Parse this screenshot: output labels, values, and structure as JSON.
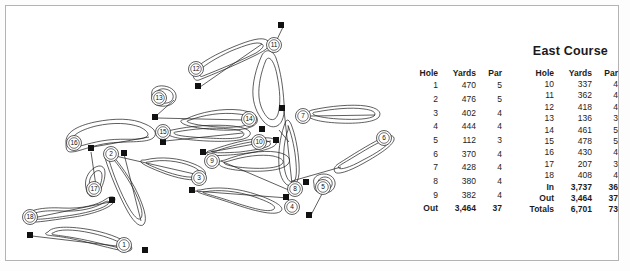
{
  "title": "East Course",
  "scorecard": {
    "columns": [
      "Hole",
      "Yards",
      "Par"
    ],
    "front": [
      {
        "hole": "1",
        "yards": "470",
        "par": "5"
      },
      {
        "hole": "2",
        "yards": "476",
        "par": "5"
      },
      {
        "hole": "3",
        "yards": "402",
        "par": "4"
      },
      {
        "hole": "4",
        "yards": "444",
        "par": "4"
      },
      {
        "hole": "5",
        "yards": "112",
        "par": "3"
      },
      {
        "hole": "6",
        "yards": "370",
        "par": "4"
      },
      {
        "hole": "7",
        "yards": "428",
        "par": "4"
      },
      {
        "hole": "8",
        "yards": "380",
        "par": "4"
      },
      {
        "hole": "9",
        "yards": "382",
        "par": "4"
      }
    ],
    "front_total": {
      "label": "Out",
      "yards": "3,464",
      "par": "37"
    },
    "back": [
      {
        "hole": "10",
        "yards": "337",
        "par": "4"
      },
      {
        "hole": "11",
        "yards": "362",
        "par": "4"
      },
      {
        "hole": "12",
        "yards": "418",
        "par": "4"
      },
      {
        "hole": "13",
        "yards": "136",
        "par": "3"
      },
      {
        "hole": "14",
        "yards": "461",
        "par": "5"
      },
      {
        "hole": "15",
        "yards": "478",
        "par": "5"
      },
      {
        "hole": "16",
        "yards": "430",
        "par": "4"
      },
      {
        "hole": "17",
        "yards": "207",
        "par": "3"
      },
      {
        "hole": "18",
        "yards": "408",
        "par": "4"
      }
    ],
    "back_totals": [
      {
        "label": "In",
        "yards": "3,737",
        "par": "36"
      },
      {
        "label": "Out",
        "yards": "3,464",
        "par": "37"
      },
      {
        "label": "Totals",
        "yards": "6,701",
        "par": "73"
      }
    ]
  },
  "map": {
    "stroke_color": "#1a1a1a",
    "marker_fill": "#111111",
    "hole_markers": [
      {
        "n": "1",
        "x": 124,
        "y": 245
      },
      {
        "n": "2",
        "x": 111,
        "y": 154
      },
      {
        "n": "3",
        "x": 199,
        "y": 178
      },
      {
        "n": "4",
        "x": 292,
        "y": 207
      },
      {
        "n": "5",
        "x": 323,
        "y": 187
      },
      {
        "n": "6",
        "x": 384,
        "y": 138
      },
      {
        "n": "7",
        "x": 303,
        "y": 116
      },
      {
        "n": "8",
        "x": 295,
        "y": 189
      },
      {
        "n": "9",
        "x": 212,
        "y": 161
      },
      {
        "n": "10",
        "x": 259,
        "y": 142
      },
      {
        "n": "11",
        "x": 274,
        "y": 45
      },
      {
        "n": "12",
        "x": 196,
        "y": 69
      },
      {
        "n": "13",
        "x": 159,
        "y": 98
      },
      {
        "n": "14",
        "x": 249,
        "y": 119
      },
      {
        "n": "15",
        "x": 163,
        "y": 132
      },
      {
        "n": "16",
        "x": 74,
        "y": 143
      },
      {
        "n": "17",
        "x": 94,
        "y": 189
      },
      {
        "n": "18",
        "x": 30,
        "y": 217
      }
    ],
    "tee_markers": [
      {
        "x": 281,
        "y": 25
      },
      {
        "x": 198,
        "y": 86
      },
      {
        "x": 155,
        "y": 117
      },
      {
        "x": 282,
        "y": 108
      },
      {
        "x": 262,
        "y": 129
      },
      {
        "x": 276,
        "y": 140
      },
      {
        "x": 163,
        "y": 142
      },
      {
        "x": 91,
        "y": 148
      },
      {
        "x": 124,
        "y": 153
      },
      {
        "x": 203,
        "y": 152
      },
      {
        "x": 306,
        "y": 182
      },
      {
        "x": 192,
        "y": 190
      },
      {
        "x": 286,
        "y": 197
      },
      {
        "x": 112,
        "y": 200
      },
      {
        "x": 309,
        "y": 215
      },
      {
        "x": 30,
        "y": 235
      },
      {
        "x": 145,
        "y": 250
      }
    ]
  }
}
